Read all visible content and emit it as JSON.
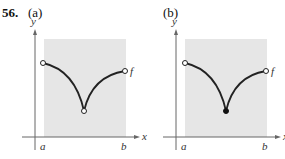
{
  "problem": {
    "number": "56."
  },
  "panels": [
    {
      "label": "(a)",
      "axis_x_label": "x",
      "axis_y_label": "y",
      "interval_left": "a",
      "interval_right": "b",
      "function_label": "f",
      "left_endpoint": "open",
      "cusp_point": "open",
      "right_endpoint": "open"
    },
    {
      "label": "(b)",
      "axis_x_label": "x",
      "axis_y_label": "y",
      "interval_left": "a",
      "interval_right": "b",
      "function_label": "f",
      "left_endpoint": "open",
      "cusp_point": "closed",
      "right_endpoint": "open"
    }
  ],
  "colors": {
    "shade": "#e6e6e6",
    "curve": "#222222",
    "axis": "#666666"
  }
}
